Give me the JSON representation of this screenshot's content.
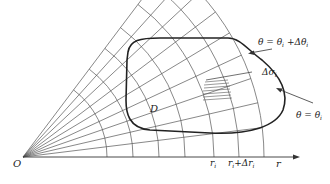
{
  "figure": {
    "width": 330,
    "height": 184,
    "origin": {
      "x": 23,
      "y": 157
    },
    "axis_end_x": 300,
    "ray_angles_deg": [
      0,
      7,
      13,
      19,
      25,
      31,
      37,
      43,
      48,
      53
    ],
    "ray_length": 241,
    "arc_radii": [
      84,
      110,
      136,
      162,
      191,
      216,
      241
    ],
    "arc_max_angle_deg": 53,
    "region_D": {
      "label": "D",
      "path": "M 128 52 C 130 40, 140 38, 160 38 L 228 38 C 240 38, 248 50, 262 60 C 276 72, 290 90, 283 110 C 276 126, 250 135, 210 133 L 150 130 C 128 128, 126 112, 126 100 L 127 60 Z"
    },
    "labels": {
      "origin": "O",
      "D": "D",
      "r_axis": "r",
      "r_i": "r",
      "r_i_sub": "i",
      "r_i_plus": "r",
      "r_i_plus_sub": "i",
      "r_i_plus_rest": "+Δr",
      "r_i_plus_rest_sub": "i",
      "theta_upper": "θ = θ",
      "theta_upper_sub": "i",
      "theta_upper_rest": " +Δθ",
      "theta_upper_rest_sub": "i",
      "delta_sigma": "Δσ",
      "delta_sigma_sub": "i",
      "theta_lower": "θ = θ",
      "theta_lower_sub": "i"
    },
    "colors": {
      "grid": "#555555",
      "boundary": "#222222",
      "text": "#222222",
      "background": "#ffffff"
    }
  }
}
